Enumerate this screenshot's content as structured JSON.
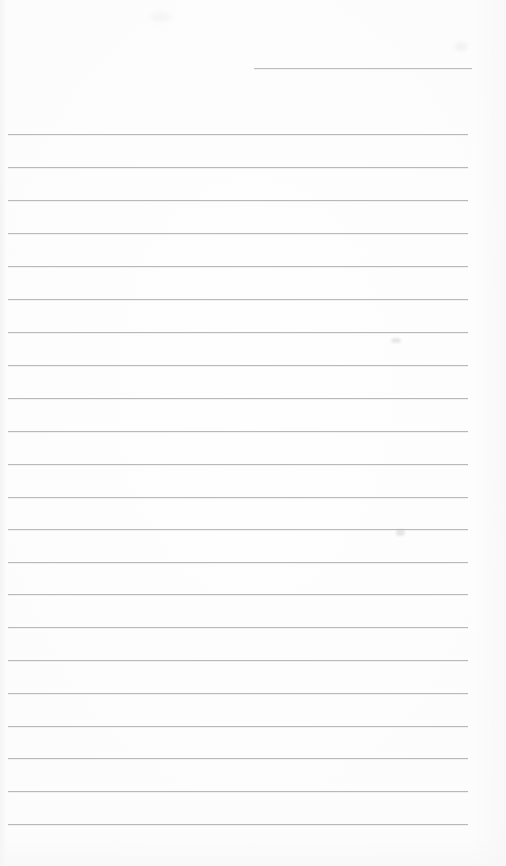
{
  "document": {
    "type": "ruled-writing-page",
    "title": "",
    "body_text": "",
    "background_color": "#fefefe",
    "rule_color": "#b4b6ba",
    "page_width": 506,
    "page_height": 866
  },
  "header_rule": {
    "name": "date-line",
    "label": "",
    "x_start": 254,
    "x_end": 472,
    "y": 68,
    "width": 218
  },
  "ruled_lines": {
    "count": 22,
    "x_start": 8,
    "x_end": 468,
    "width": 460,
    "spacing": 32.85,
    "first_y": 134,
    "last_y": 824,
    "items": [
      {
        "index": 1,
        "y": 134,
        "text": ""
      },
      {
        "index": 2,
        "y": 167,
        "text": ""
      },
      {
        "index": 3,
        "y": 200,
        "text": ""
      },
      {
        "index": 4,
        "y": 233,
        "text": ""
      },
      {
        "index": 5,
        "y": 266,
        "text": ""
      },
      {
        "index": 6,
        "y": 299,
        "text": ""
      },
      {
        "index": 7,
        "y": 332,
        "text": ""
      },
      {
        "index": 8,
        "y": 365,
        "text": ""
      },
      {
        "index": 9,
        "y": 398,
        "text": ""
      },
      {
        "index": 10,
        "y": 431,
        "text": ""
      },
      {
        "index": 11,
        "y": 464,
        "text": ""
      },
      {
        "index": 12,
        "y": 497,
        "text": ""
      },
      {
        "index": 13,
        "y": 529,
        "text": ""
      },
      {
        "index": 14,
        "y": 562,
        "text": ""
      },
      {
        "index": 15,
        "y": 594,
        "text": ""
      },
      {
        "index": 16,
        "y": 627,
        "text": ""
      },
      {
        "index": 17,
        "y": 660,
        "text": ""
      },
      {
        "index": 18,
        "y": 693,
        "text": ""
      },
      {
        "index": 19,
        "y": 726,
        "text": ""
      },
      {
        "index": 20,
        "y": 758,
        "text": ""
      },
      {
        "index": 21,
        "y": 791,
        "text": ""
      },
      {
        "index": 22,
        "y": 824,
        "text": ""
      }
    ]
  },
  "marks": [
    {
      "name": "scan-smudge-upper",
      "x": 391,
      "y": 338
    },
    {
      "name": "scan-smudge-lower",
      "x": 396,
      "y": 529
    }
  ]
}
